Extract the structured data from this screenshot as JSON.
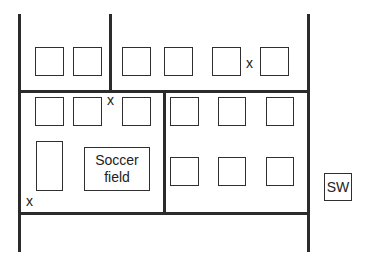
{
  "diagram": {
    "type": "site map / floor plan",
    "markers": [
      {
        "label": "x",
        "position": "top row between 5th and 6th building"
      },
      {
        "label": "x",
        "position": "junction of central vertical line and middle horizontal line"
      },
      {
        "label": "x",
        "position": "bottom-left corner of lower-left block"
      }
    ],
    "soccer_field": {
      "label": "Soccer\nfield",
      "line1": "Soccer",
      "line2": "field"
    },
    "sw_box": {
      "label": "SW"
    },
    "buildings": {
      "top_row": 6,
      "middle_left": 3,
      "middle_right": 3,
      "bottom_right": 3,
      "tall_rect_left": 1
    }
  }
}
